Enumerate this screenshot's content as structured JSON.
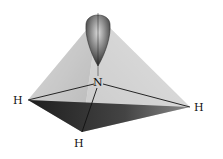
{
  "diagram": {
    "type": "molecular-geometry",
    "molecule": "ammonia (trigonal pyramidal with lone pair)",
    "central_atom": {
      "label": "N",
      "x": 98,
      "y": 82
    },
    "lone_pair_lobe": {
      "top": 10,
      "bottom": 66,
      "cx": 98,
      "width": 26
    },
    "apex": {
      "x": 98,
      "y": 16
    },
    "atoms": [
      {
        "label": "H",
        "label_x": 13,
        "label_y": 104,
        "vertex_x": 28,
        "vertex_y": 100
      },
      {
        "label": "H",
        "label_x": 194,
        "label_y": 111,
        "vertex_x": 190,
        "vertex_y": 107
      },
      {
        "label": "H",
        "label_x": 74,
        "label_y": 147,
        "vertex_x": 82,
        "vertex_y": 132
      }
    ],
    "colors": {
      "face_light": "#d8d8d8",
      "face_mid": "#a8a8a8",
      "base_dark": "#2a2a2a",
      "lobe": "#6a6a6a",
      "bond": "#111111"
    }
  }
}
